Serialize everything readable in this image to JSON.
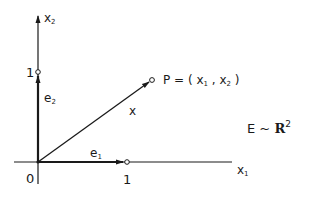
{
  "diagram": {
    "axes": {
      "x_axis": {
        "name": "x",
        "subscript": "1"
      },
      "y_axis": {
        "name": "x",
        "subscript": "2"
      },
      "origin_label": "0"
    },
    "ticks": {
      "x_unit": "1",
      "y_unit": "1"
    },
    "basis_vectors": [
      {
        "name": "e",
        "subscript": "1",
        "direction": "x"
      },
      {
        "name": "e",
        "subscript": "2",
        "direction": "y"
      }
    ],
    "vector": {
      "label": "x"
    },
    "point": {
      "prefix": "P = ( ",
      "c1": "x",
      "c1_sub": "1",
      "sep": " , ",
      "c2": "x",
      "c2_sub": "2",
      "suffix": " )"
    },
    "space": {
      "lhs": "E",
      "rel": " ~ ",
      "set": "R",
      "exponent": "2"
    },
    "colors": {
      "ink": "#1a1a1a",
      "background": "#ffffff"
    }
  }
}
